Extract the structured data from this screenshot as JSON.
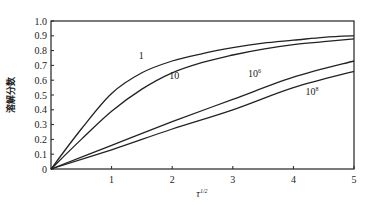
{
  "chart_data": {
    "type": "line",
    "title": "",
    "xlabel": "τ^1/2",
    "xlabel_base": "τ",
    "xlabel_sup": "1/2",
    "ylabel": "溶解分数",
    "xlim": [
      0,
      5
    ],
    "ylim": [
      0,
      1.0
    ],
    "grid": false,
    "legend": "inline curve labels",
    "x_ticks": [
      "1",
      "2",
      "3",
      "4",
      "5"
    ],
    "y_ticks": [
      "0",
      "0.1",
      "0.2",
      "0.3",
      "0.4",
      "0.5",
      "0.6",
      "0.7",
      "0.8",
      "0.9",
      "1.0"
    ],
    "series": [
      {
        "name": "1",
        "label_base": "1",
        "label_sup": "",
        "x": [
          0,
          0.5,
          1,
          1.5,
          2,
          2.5,
          3,
          3.5,
          4,
          4.5,
          5
        ],
        "values": [
          0,
          0.27,
          0.51,
          0.65,
          0.73,
          0.78,
          0.82,
          0.85,
          0.87,
          0.89,
          0.9
        ],
        "label_pos": [
          1.45,
          0.745
        ]
      },
      {
        "name": "10",
        "label_base": "10",
        "label_sup": "",
        "x": [
          0,
          0.5,
          1,
          1.5,
          2,
          2.5,
          3,
          3.5,
          4,
          4.5,
          5
        ],
        "values": [
          0,
          0.2,
          0.39,
          0.54,
          0.65,
          0.72,
          0.77,
          0.81,
          0.84,
          0.86,
          0.88
        ],
        "label_pos": [
          1.95,
          0.61
        ]
      },
      {
        "name": "10^6",
        "label_base": "10",
        "label_sup": "6",
        "x": [
          0,
          1,
          2,
          3,
          4,
          5
        ],
        "values": [
          0,
          0.16,
          0.32,
          0.47,
          0.62,
          0.73
        ],
        "label_pos": [
          3.25,
          0.62
        ]
      },
      {
        "name": "10^8",
        "label_base": "10",
        "label_sup": "8",
        "x": [
          0,
          1,
          2,
          3,
          4,
          5
        ],
        "values": [
          0,
          0.13,
          0.27,
          0.4,
          0.55,
          0.66
        ],
        "label_pos": [
          4.2,
          0.5
        ]
      }
    ]
  }
}
